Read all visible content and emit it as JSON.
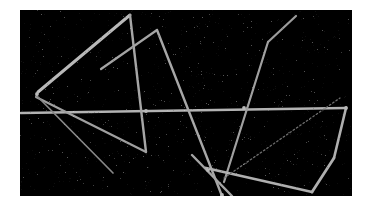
{
  "figure": {
    "background_color": "#ffffff",
    "canvas_color": "#000000",
    "line_color": "#b9b9b9",
    "faint_line_color": "#6e6e6e",
    "canvas": {
      "x": 20,
      "y": 10,
      "width": 332,
      "height": 186
    }
  },
  "chart_data": {
    "type": "scatter",
    "title": "",
    "xlabel": "",
    "ylabel": "",
    "xlim": [
      20,
      352
    ],
    "ylim": [
      10,
      196
    ],
    "grid": false,
    "legend": "none",
    "units": "pixels",
    "segments": [
      {
        "name": "long-horizontal-baseline",
        "x1": 21,
        "y1": 113,
        "x2": 346,
        "y2": 108,
        "width": 2.6,
        "brightness": 0.92
      },
      {
        "name": "triangle-upper-left-edge",
        "x1": 38,
        "y1": 92,
        "x2": 130,
        "y2": 15,
        "width": 3.0,
        "brightness": 0.95
      },
      {
        "name": "triangle-right-descending-edge",
        "x1": 130,
        "y1": 15,
        "x2": 146,
        "y2": 152,
        "width": 2.4,
        "brightness": 0.85
      },
      {
        "name": "triangle-lower-return-edge",
        "x1": 146,
        "y1": 152,
        "x2": 36,
        "y2": 97,
        "width": 2.2,
        "brightness": 0.82
      },
      {
        "name": "fan-line-to-lower-right",
        "x1": 36,
        "y1": 95,
        "x2": 113,
        "y2": 173,
        "width": 1.7,
        "brightness": 0.7
      },
      {
        "name": "second-peak-left-rise",
        "x1": 101,
        "y1": 69,
        "x2": 157,
        "y2": 30,
        "width": 2.2,
        "brightness": 0.84
      },
      {
        "name": "second-peak-long-fall",
        "x1": 157,
        "y1": 30,
        "x2": 222,
        "y2": 196,
        "width": 2.4,
        "brightness": 0.86
      },
      {
        "name": "bent-line-upper-right-top",
        "x1": 296,
        "y1": 16,
        "x2": 268,
        "y2": 42,
        "width": 2.2,
        "brightness": 0.8
      },
      {
        "name": "bent-line-upper-right-descent",
        "x1": 268,
        "y1": 42,
        "x2": 224,
        "y2": 182,
        "width": 2.2,
        "brightness": 0.82
      },
      {
        "name": "lower-left-spur",
        "x1": 192,
        "y1": 155,
        "x2": 232,
        "y2": 196,
        "width": 2.4,
        "brightness": 0.84
      },
      {
        "name": "bottom-horizontal-run",
        "x1": 206,
        "y1": 168,
        "x2": 312,
        "y2": 192,
        "width": 2.8,
        "brightness": 0.9
      },
      {
        "name": "bottom-right-rise",
        "x1": 312,
        "y1": 192,
        "x2": 334,
        "y2": 158,
        "width": 2.8,
        "brightness": 0.9
      },
      {
        "name": "right-vertical-edge",
        "x1": 334,
        "y1": 158,
        "x2": 346,
        "y2": 108,
        "width": 2.6,
        "brightness": 0.9
      },
      {
        "name": "faint-dotted-diagonal",
        "x1": 224,
        "y1": 178,
        "x2": 340,
        "y2": 98,
        "width": 1.3,
        "brightness": 0.42
      }
    ],
    "junctions": [
      {
        "name": "left-fan-node",
        "x": 37,
        "y": 94
      },
      {
        "name": "horizontal-crossing-mid",
        "x": 146,
        "y": 111
      },
      {
        "name": "horizontal-crossing-right",
        "x": 244,
        "y": 108
      },
      {
        "name": "bottom-v-node",
        "x": 222,
        "y": 195
      },
      {
        "name": "lower-left-cross",
        "x": 208,
        "y": 170
      },
      {
        "name": "right-corner-node",
        "x": 346,
        "y": 108
      }
    ]
  }
}
